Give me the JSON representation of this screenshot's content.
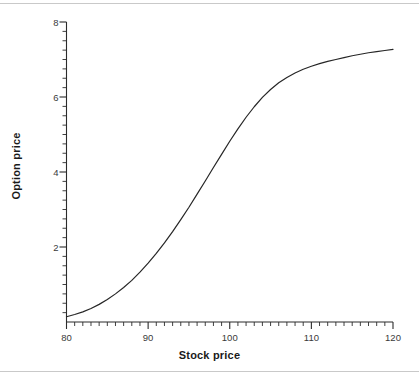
{
  "figure": {
    "background_color": "#ffffff",
    "line_color": "#262626",
    "rule_color": "#c9c9c9",
    "tick_label_color": "#3a3a3a"
  },
  "chart_data": {
    "type": "line",
    "title": "",
    "subtitle": "",
    "xlabel": "Stock price",
    "ylabel": "Option price",
    "xlim": [
      80,
      120
    ],
    "ylim": [
      0,
      8
    ],
    "grid": false,
    "legend": null,
    "legend_position": "none",
    "x_major_ticks": [
      80,
      90,
      100,
      110,
      120
    ],
    "x_major_tick_labels": [
      "80",
      "90",
      "100",
      "110",
      "120"
    ],
    "x_minor_tick_step": 1,
    "y_major_ticks": [
      2,
      4,
      6,
      8
    ],
    "y_major_tick_labels": [
      "2",
      "4",
      "6",
      "8"
    ],
    "y_minor_tick_step": 0.25,
    "axis_spines": [
      "left",
      "bottom"
    ],
    "series": [
      {
        "name": "Option price",
        "color": "#262626",
        "line_width": 1.2,
        "x": [
          80,
          81,
          82,
          83,
          84,
          85,
          86,
          87,
          88,
          89,
          90,
          91,
          92,
          93,
          94,
          95,
          96,
          97,
          98,
          99,
          100,
          101,
          102,
          103,
          104,
          105,
          106,
          107,
          108,
          109,
          110,
          111,
          112,
          113,
          114,
          115,
          116,
          117,
          118,
          119,
          120
        ],
        "y": [
          0.14,
          0.2,
          0.27,
          0.36,
          0.47,
          0.6,
          0.75,
          0.92,
          1.11,
          1.33,
          1.57,
          1.83,
          2.11,
          2.41,
          2.73,
          3.06,
          3.41,
          3.76,
          4.12,
          4.47,
          4.82,
          5.15,
          5.46,
          5.74,
          5.99,
          6.2,
          6.38,
          6.52,
          6.64,
          6.74,
          6.82,
          6.89,
          6.95,
          7.0,
          7.05,
          7.1,
          7.14,
          7.18,
          7.21,
          7.24,
          7.27
        ]
      }
    ]
  }
}
